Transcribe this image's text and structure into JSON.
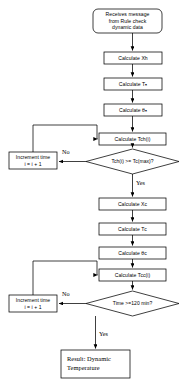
{
  "diagram": {
    "colors": {
      "stroke": "#000000",
      "fill": "#ffffff",
      "text": "#000000",
      "background": "#ffffff"
    },
    "nodes": [
      {
        "id": "start",
        "shape": "rounded-rectangle",
        "label": "Receives message\nfrom Rule check\ndynamic data"
      },
      {
        "id": "calc-xh",
        "shape": "rectangle",
        "label": "Calculate Xh"
      },
      {
        "id": "calc-th",
        "shape": "rectangle",
        "label": "Calculate Tₕ"
      },
      {
        "id": "calc-theta-h",
        "shape": "rectangle",
        "label": "Calculate θₕ"
      },
      {
        "id": "calc-tch",
        "shape": "rectangle",
        "label": "Calculate Tch(i)"
      },
      {
        "id": "decision-tch",
        "shape": "diamond",
        "label": "Tch(i) >= Tc(max)?"
      },
      {
        "id": "increment-time-1",
        "shape": "rectangle",
        "label": "Increment time\ni = i + 1"
      },
      {
        "id": "calc-xc",
        "shape": "rectangle",
        "label": "Calculate Xc"
      },
      {
        "id": "calc-tc",
        "shape": "rectangle",
        "label": "Calculate Tᴄ"
      },
      {
        "id": "calc-theta-c",
        "shape": "rectangle",
        "label": "Calculate θᴄ"
      },
      {
        "id": "calc-tcc",
        "shape": "rectangle",
        "label": "Calculate Tcc(i)"
      },
      {
        "id": "decision-time",
        "shape": "diamond",
        "label": "Time >=120 min?"
      },
      {
        "id": "increment-time-2",
        "shape": "rectangle",
        "label": "Increment time\ni = i + 1"
      },
      {
        "id": "result",
        "shape": "rectangle",
        "label": "Result: Dynamic\nTemperature"
      }
    ],
    "edge_labels": [
      {
        "id": "no-1",
        "text": "No"
      },
      {
        "id": "yes-1",
        "text": "Yes"
      },
      {
        "id": "no-2",
        "text": "No"
      },
      {
        "id": "yes-2",
        "text": "Yes"
      }
    ]
  }
}
